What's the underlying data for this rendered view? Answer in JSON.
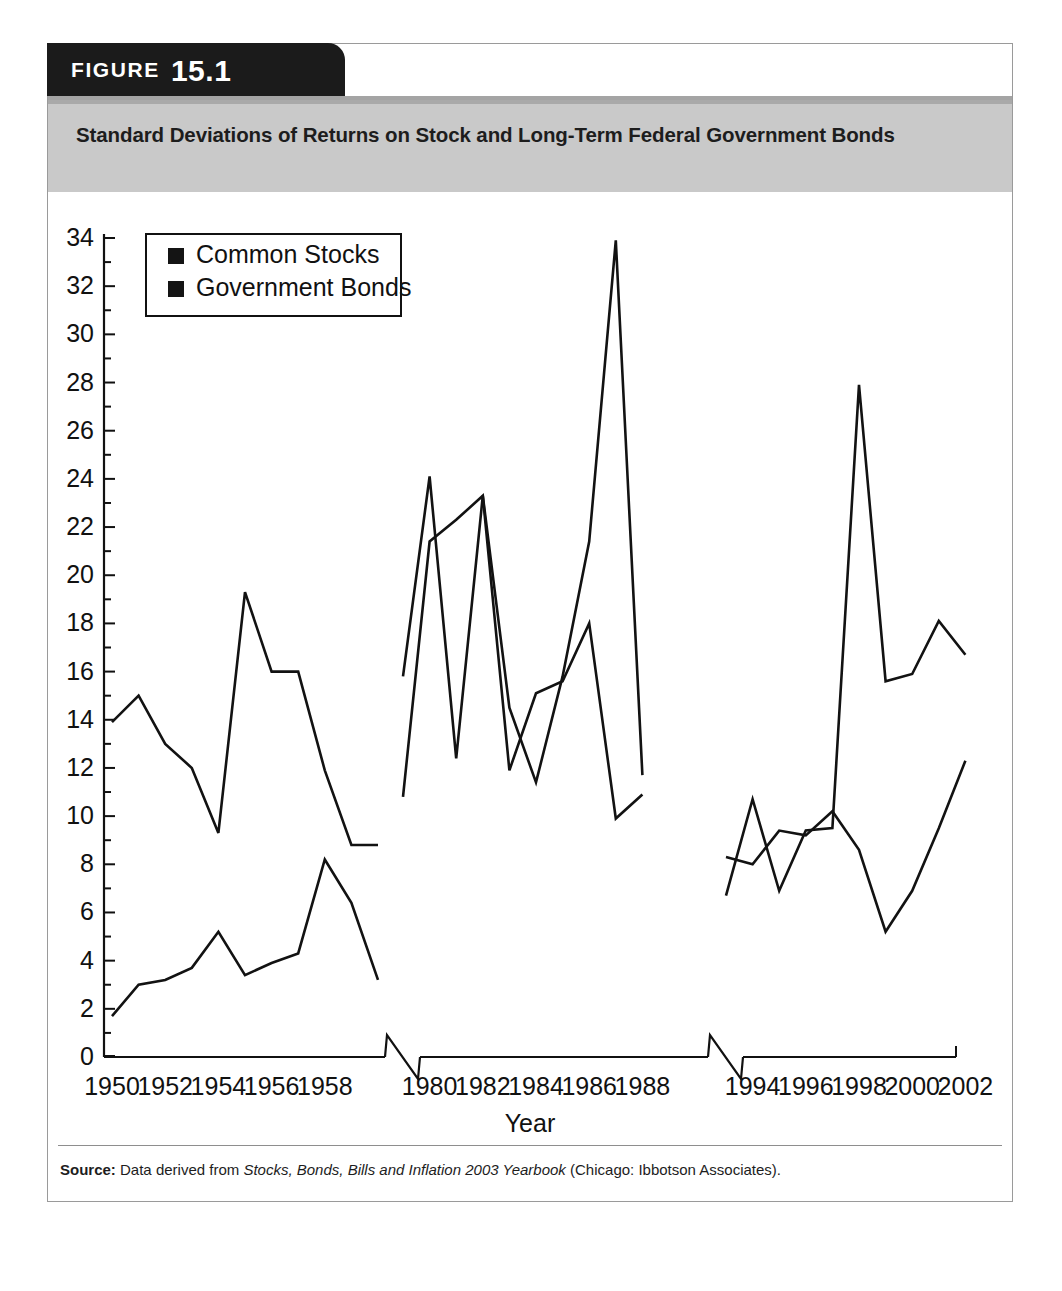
{
  "figure": {
    "label": "FIGURE",
    "number": "15.1",
    "title": "Standard Deviations of Returns on Stock and Long-Term Federal Government Bonds"
  },
  "source": {
    "prefix": "Source:",
    "text_before": "Data derived from",
    "italic_title": "Stocks, Bonds, Bills and Inflation 2003 Yearbook",
    "text_after": "(Chicago: Ibbotson Associates)."
  },
  "legend": {
    "items": [
      {
        "label": "Common Stocks",
        "color": "#141414"
      },
      {
        "label": "Government Bonds",
        "color": "#141414"
      }
    ]
  },
  "axes": {
    "xlabel": "Year",
    "ylabel": "",
    "y_ticks": [
      "0",
      "2",
      "4",
      "6",
      "8",
      "10",
      "12",
      "14",
      "16",
      "18",
      "20",
      "22",
      "24",
      "26",
      "28",
      "30",
      "32",
      "34"
    ],
    "x_ticks": [
      "1950",
      "1952",
      "1954",
      "1956",
      "1958",
      "1980",
      "1982",
      "1984",
      "1986",
      "1988",
      "1994",
      "1996",
      "1998",
      "2000",
      "2002"
    ],
    "ylim": [
      0,
      34
    ],
    "axis_breaks": 2,
    "grid": false
  },
  "chart_data": {
    "type": "line",
    "title": "Standard Deviations of Returns on Stock and Long-Term Federal Government Bonds",
    "xlabel": "Year",
    "ylabel": "",
    "ylim": [
      0,
      34
    ],
    "grid": false,
    "legend_position": "top-left",
    "axis_breaks": [
      "1959-1979",
      "1989-1993"
    ],
    "segments": [
      {
        "name": "1950s",
        "x": [
          1950,
          1951,
          1952,
          1953,
          1954,
          1955,
          1956,
          1957,
          1958,
          1959
        ],
        "series": [
          {
            "name": "Common Stocks",
            "values": [
              13.9,
              15.0,
              13.0,
              12.0,
              9.3,
              19.3,
              16.0,
              16.0,
              11.9,
              8.8,
              8.8
            ]
          },
          {
            "name": "Government Bonds",
            "values": [
              1.7,
              3.0,
              3.2,
              3.7,
              5.2,
              3.4,
              3.9,
              4.3,
              8.2,
              6.4,
              3.2
            ]
          }
        ]
      },
      {
        "name": "1980s",
        "x": [
          1979,
          1980,
          1981,
          1982,
          1983,
          1984,
          1985,
          1986,
          1987,
          1988,
          1989
        ],
        "series": [
          {
            "name": "Common Stocks",
            "values": [
              15.8,
              24.1,
              12.4,
              23.3,
              14.5,
              11.4,
              15.8,
              21.4,
              33.9,
              11.7
            ]
          },
          {
            "name": "Government Bonds",
            "values": [
              10.8,
              21.4,
              22.3,
              23.3,
              11.9,
              15.1,
              15.6,
              18.0,
              9.9,
              10.9
            ]
          }
        ]
      },
      {
        "name": "1990s",
        "x": [
          1993,
          1994,
          1995,
          1996,
          1997,
          1998,
          1999,
          2000,
          2001,
          2002
        ],
        "series": [
          {
            "name": "Common Stocks",
            "values": [
              6.7,
              10.7,
              6.9,
              9.4,
              9.5,
              27.9,
              15.6,
              15.9,
              18.1,
              16.7
            ]
          },
          {
            "name": "Government Bonds",
            "values": [
              8.3,
              8.0,
              9.4,
              9.2,
              10.2,
              8.6,
              5.2,
              6.9,
              9.5,
              12.3
            ]
          }
        ]
      }
    ]
  }
}
